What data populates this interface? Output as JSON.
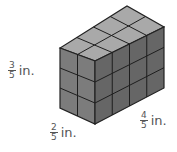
{
  "figure": {
    "type": "rectangular prism made of unit cubes",
    "cubes": {
      "length": 4,
      "width": 2,
      "height": 3
    },
    "colors": {
      "top": "#a6a6a6",
      "front": "#7a7a7a",
      "side": "#5e5e5e",
      "edge": "#222222"
    }
  },
  "labels": {
    "height": {
      "num": "3",
      "den": "5",
      "unit": "in."
    },
    "width": {
      "num": "2",
      "den": "5",
      "unit": "in."
    },
    "length": {
      "num": "4",
      "den": "5",
      "unit": "in."
    }
  }
}
